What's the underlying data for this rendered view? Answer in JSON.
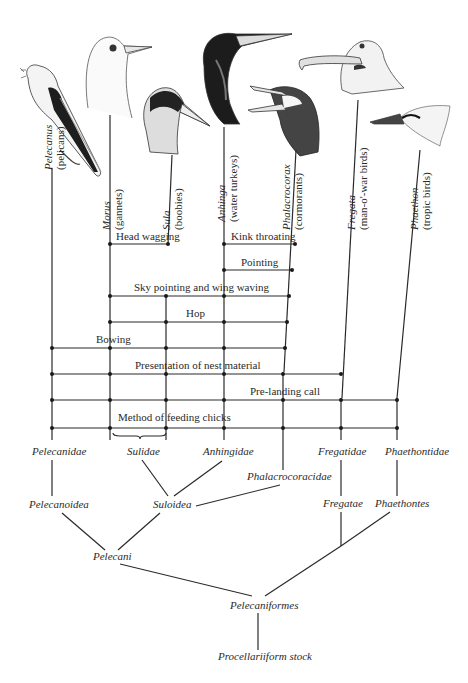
{
  "taxa": [
    {
      "genus": "Pelecanus",
      "common": "(pelicans)",
      "head_icon": "pelican-head-icon"
    },
    {
      "genus": "Morus",
      "common": "(gannets)",
      "head_icon": "gannet-head-icon"
    },
    {
      "genus": "Sula",
      "common": "(boobies)",
      "head_icon": "booby-head-icon"
    },
    {
      "genus": "Anhinga",
      "common": "(water turkeys)",
      "head_icon": "anhinga-head-icon"
    },
    {
      "genus": "Phalacrocorax",
      "common": "(cormorants)",
      "head_icon": "cormorant-head-icon"
    },
    {
      "genus": "Fregata",
      "common": "(man-o'-war birds)",
      "head_icon": "frigatebird-head-icon"
    },
    {
      "genus": "Phaethon",
      "common": "(tropic birds)",
      "head_icon": "tropicbird-head-icon"
    }
  ],
  "characters": [
    {
      "label": "Head wagging"
    },
    {
      "label": "Kink throating"
    },
    {
      "label": "Pointing"
    },
    {
      "label": "Sky pointing and wing waving"
    },
    {
      "label": "Hop"
    },
    {
      "label": "Bowing"
    },
    {
      "label": "Presentation of nest material"
    },
    {
      "label": "Pre-landing call"
    },
    {
      "label": "Method of feeding chicks"
    }
  ],
  "families": [
    "Pelecanidae",
    "Sulidae",
    "Anhingidae",
    "Phalacrocoracidae",
    "Fregatidae",
    "Phaethontidae"
  ],
  "superfamilies": [
    "Pelecanoidea",
    "Suloidea",
    "Fregatae",
    "Phaethontes"
  ],
  "suborder": "Pelecani",
  "order": "Pelecaniformes",
  "root": "Procellariiform stock"
}
